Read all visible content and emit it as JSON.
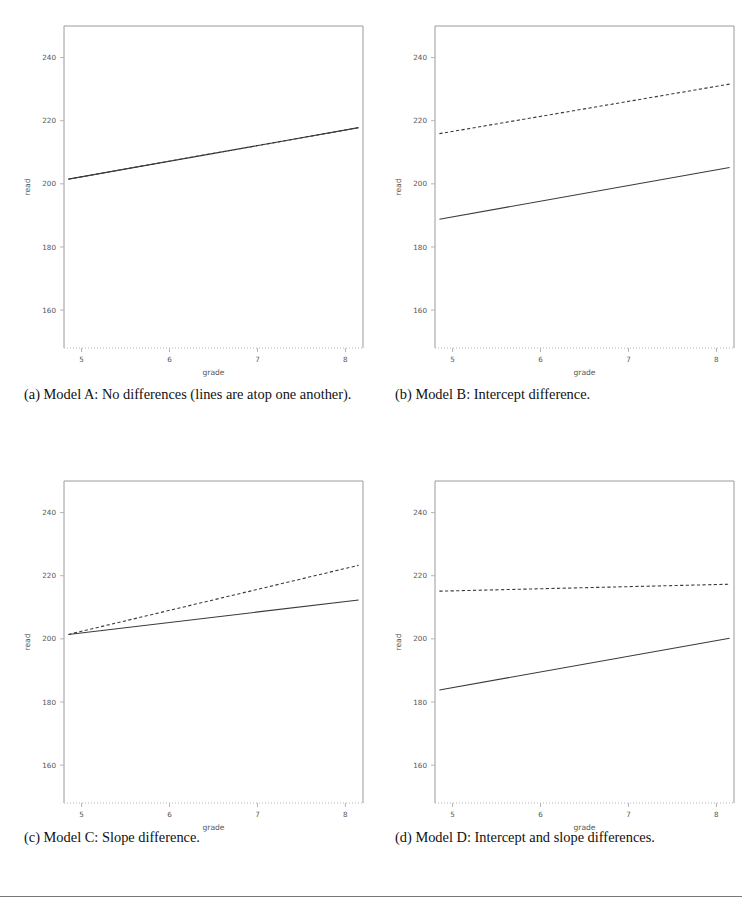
{
  "figure": {
    "panels": [
      {
        "key": "a",
        "caption": "(a) Model A: No differences (lines are atop one another)."
      },
      {
        "key": "b",
        "caption": "(b) Model B: Intercept difference."
      },
      {
        "key": "c",
        "caption": "(c) Model C: Slope difference."
      },
      {
        "key": "d",
        "caption": "(d) Model D: Intercept and slope differences."
      }
    ]
  },
  "chart_data": [
    {
      "panel": "a",
      "type": "line",
      "title": "Model A: No differences (lines are atop one another)",
      "xlabel": "grade",
      "ylabel": "read",
      "xlim": [
        4.8,
        8.2
      ],
      "ylim": [
        148,
        250
      ],
      "xticks": [
        5,
        6,
        7,
        8
      ],
      "yticks": [
        160,
        180,
        200,
        220,
        240
      ],
      "grid": false,
      "legend": "none",
      "series": [
        {
          "name": "group 1 (solid)",
          "style": "solid",
          "x": [
            4.85,
            8.15
          ],
          "y": [
            201.5,
            217.8
          ]
        },
        {
          "name": "group 2 (dashed, overlapping)",
          "style": "dashed",
          "x": [
            4.85,
            8.15
          ],
          "y": [
            201.5,
            217.8
          ]
        }
      ]
    },
    {
      "panel": "b",
      "type": "line",
      "title": "Model B: Intercept difference",
      "xlabel": "grade",
      "ylabel": "read",
      "xlim": [
        4.8,
        8.2
      ],
      "ylim": [
        148,
        250
      ],
      "xticks": [
        5,
        6,
        7,
        8
      ],
      "yticks": [
        160,
        180,
        200,
        220,
        240
      ],
      "grid": false,
      "legend": "none",
      "series": [
        {
          "name": "group 1 (solid)",
          "style": "solid",
          "x": [
            4.85,
            8.15
          ],
          "y": [
            188.8,
            205.2
          ]
        },
        {
          "name": "group 2 (dashed)",
          "style": "dashed",
          "x": [
            4.85,
            8.15
          ],
          "y": [
            215.9,
            231.6
          ]
        }
      ]
    },
    {
      "panel": "c",
      "type": "line",
      "title": "Model C: Slope difference",
      "xlabel": "grade",
      "ylabel": "read",
      "xlim": [
        4.8,
        8.2
      ],
      "ylim": [
        148,
        250
      ],
      "xticks": [
        5,
        6,
        7,
        8
      ],
      "yticks": [
        160,
        180,
        200,
        220,
        240
      ],
      "grid": false,
      "legend": "none",
      "series": [
        {
          "name": "group 1 (solid)",
          "style": "solid",
          "x": [
            4.85,
            8.15
          ],
          "y": [
            201.4,
            212.3
          ]
        },
        {
          "name": "group 2 (dashed)",
          "style": "dashed",
          "x": [
            4.85,
            8.15
          ],
          "y": [
            201.4,
            223.3
          ]
        }
      ]
    },
    {
      "panel": "d",
      "type": "line",
      "title": "Model D: Intercept and slope differences",
      "xlabel": "grade",
      "ylabel": "read",
      "xlim": [
        4.8,
        8.2
      ],
      "ylim": [
        148,
        250
      ],
      "xticks": [
        5,
        6,
        7,
        8
      ],
      "yticks": [
        160,
        180,
        200,
        220,
        240
      ],
      "grid": false,
      "legend": "none",
      "series": [
        {
          "name": "group 1 (solid)",
          "style": "solid",
          "x": [
            4.85,
            8.15
          ],
          "y": [
            183.8,
            200.2
          ]
        },
        {
          "name": "group 2 (dashed)",
          "style": "dashed",
          "x": [
            4.85,
            8.15
          ],
          "y": [
            215.1,
            217.3
          ]
        }
      ]
    }
  ],
  "colors": {
    "line": "#3a3a3a",
    "frame": "#9a9a9a",
    "axis": "#b5b5b5",
    "text": "#555555",
    "caption": "#111111",
    "rule": "#777777"
  }
}
